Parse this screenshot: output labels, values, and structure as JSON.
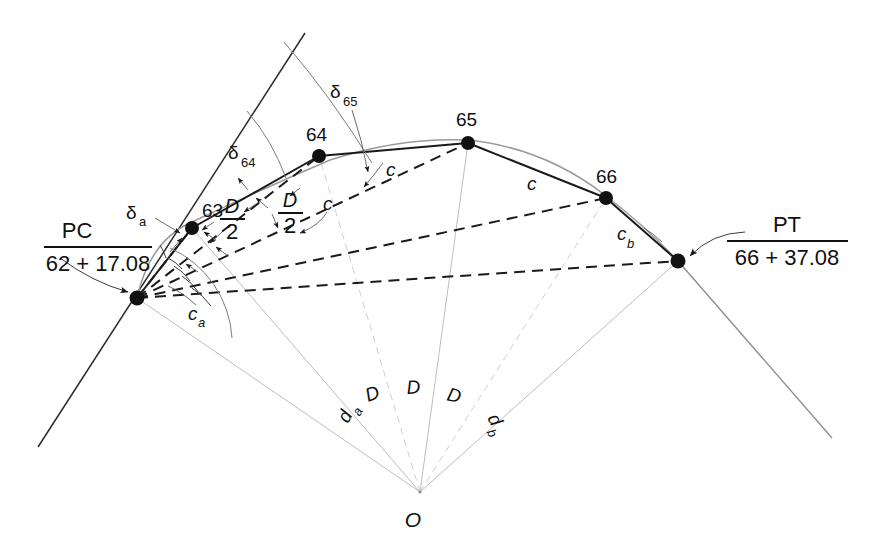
{
  "figure": {
    "colors": {
      "ink": "#111111",
      "tangent": "#2b2b2b",
      "arc": "#9a9a9a",
      "radial": "#bdbdbd",
      "leader": "#3a3a3a"
    },
    "points": {
      "pc": {
        "label_top": "PC",
        "label_bottom": "62 + 17.08",
        "x": 137,
        "y": 298
      },
      "pt": {
        "label_top": "PT",
        "label_bottom": "66 + 37.08",
        "x": 678,
        "y": 261
      },
      "s63": {
        "label": "63",
        "x": 192,
        "y": 228
      },
      "s64": {
        "label": "64",
        "x": 319,
        "y": 156
      },
      "s65": {
        "label": "65",
        "x": 468,
        "y": 143
      },
      "s66": {
        "label": "66",
        "x": 606,
        "y": 198
      },
      "o": {
        "label": "O",
        "x": 420,
        "y": 492
      }
    },
    "labels": {
      "delta_a": {
        "text": "δ",
        "sub": "a",
        "x": 133,
        "y": 213
      },
      "delta_64": {
        "text": "δ",
        "sub": "64",
        "x": 233,
        "y": 158
      },
      "delta_65": {
        "text": "δ",
        "sub": "65",
        "x": 352,
        "y": 100
      },
      "chord_c1": {
        "text": "c",
        "x": 330,
        "y": 203
      },
      "chord_c2": {
        "text": "c",
        "x": 391,
        "y": 170
      },
      "chord_c3": {
        "text": "c",
        "x": 531,
        "y": 182
      },
      "chord_ca": {
        "text": "c",
        "sub": "a",
        "x": 196,
        "y": 315
      },
      "chord_cb": {
        "text": "c",
        "sub": "b",
        "x": 624,
        "y": 237
      },
      "half_D_1": {
        "num": "D",
        "den": "2",
        "x": 232,
        "y": 212
      },
      "half_D_2": {
        "num": "D",
        "den": "2",
        "x": 288,
        "y": 206
      },
      "deg_da": {
        "text": "d",
        "sub": "a",
        "x": 348,
        "y": 424
      },
      "deg_D1": {
        "text": "D",
        "x": 375,
        "y": 400
      },
      "deg_D2": {
        "text": "D",
        "x": 414,
        "y": 392
      },
      "deg_D3": {
        "text": "D",
        "x": 453,
        "y": 398
      },
      "deg_db": {
        "text": "d",
        "sub": "b",
        "x": 487,
        "y": 418
      }
    },
    "geometry": {
      "back_tangent": {
        "x1": 305,
        "y1": 33,
        "x2": 38,
        "y2": 447
      },
      "forward_tangent": {
        "x1": 678,
        "y1": 261,
        "x2": 832,
        "y2": 438
      },
      "radius_note": "radials drawn from O to PC, 63, 64, 65, 66, PT"
    }
  }
}
